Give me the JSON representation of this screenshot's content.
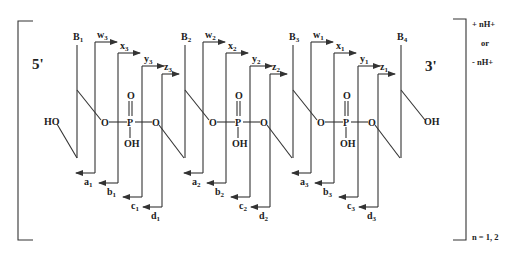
{
  "figure": {
    "left_terminus": "5'",
    "right_terminus": "3'",
    "five_prime_group": "HO",
    "three_prime_group": "OH",
    "charge_top": "+ nH+",
    "charge_or": "or",
    "charge_bottom": "- nH+",
    "n_values": "n = 1, 2",
    "phosphate": {
      "double_bond_O": "O",
      "P": "P",
      "bridge_O": "O",
      "hydroxyl": "OH"
    },
    "bases": [
      {
        "label": "B",
        "sub": "1"
      },
      {
        "label": "B",
        "sub": "2"
      },
      {
        "label": "B",
        "sub": "3"
      },
      {
        "label": "B",
        "sub": "4"
      }
    ],
    "units": [
      {
        "top": [
          {
            "l": "w",
            "s": "3"
          },
          {
            "l": "x",
            "s": "3"
          },
          {
            "l": "y",
            "s": "3"
          },
          {
            "l": "z",
            "s": "3"
          }
        ],
        "bottom": [
          {
            "l": "a",
            "s": "1"
          },
          {
            "l": "b",
            "s": "1"
          },
          {
            "l": "c",
            "s": "1"
          },
          {
            "l": "d",
            "s": "1"
          }
        ]
      },
      {
        "top": [
          {
            "l": "w",
            "s": "2"
          },
          {
            "l": "x",
            "s": "2"
          },
          {
            "l": "y",
            "s": "2"
          },
          {
            "l": "z",
            "s": "2"
          }
        ],
        "bottom": [
          {
            "l": "a",
            "s": "2"
          },
          {
            "l": "b",
            "s": "2"
          },
          {
            "l": "c",
            "s": "2"
          },
          {
            "l": "d",
            "s": "2"
          }
        ]
      },
      {
        "top": [
          {
            "l": "w",
            "s": "1"
          },
          {
            "l": "x",
            "s": "1"
          },
          {
            "l": "y",
            "s": "1"
          },
          {
            "l": "z",
            "s": "1"
          }
        ],
        "bottom": [
          {
            "l": "a",
            "s": "3"
          },
          {
            "l": "b",
            "s": "3"
          },
          {
            "l": "c",
            "s": "3"
          },
          {
            "l": "d",
            "s": "3"
          }
        ]
      }
    ]
  }
}
